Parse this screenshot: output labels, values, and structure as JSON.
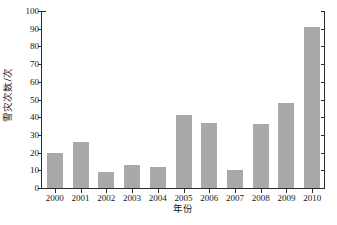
{
  "chart_data": {
    "type": "bar",
    "title": "",
    "xlabel": "年份",
    "ylabel": "雪灾次数/次",
    "categories": [
      "2000",
      "2001",
      "2002",
      "2003",
      "2004",
      "2005",
      "2006",
      "2007",
      "2008",
      "2009",
      "2010"
    ],
    "values": [
      20,
      26,
      9,
      13,
      12,
      41,
      37,
      10,
      36,
      48,
      91
    ],
    "ylim": [
      0,
      100
    ],
    "yticks": [
      0,
      10,
      20,
      30,
      40,
      50,
      60,
      70,
      80,
      90,
      100
    ],
    "ytick_labels": [
      "0",
      "10",
      "20",
      "30",
      "40",
      "50",
      "60",
      "70",
      "80",
      "90",
      "100"
    ],
    "grid": false,
    "legend": null,
    "bar_color": "#a9a9a9",
    "axis_color": "#2b2b2b",
    "background_color": "#ffffff"
  }
}
